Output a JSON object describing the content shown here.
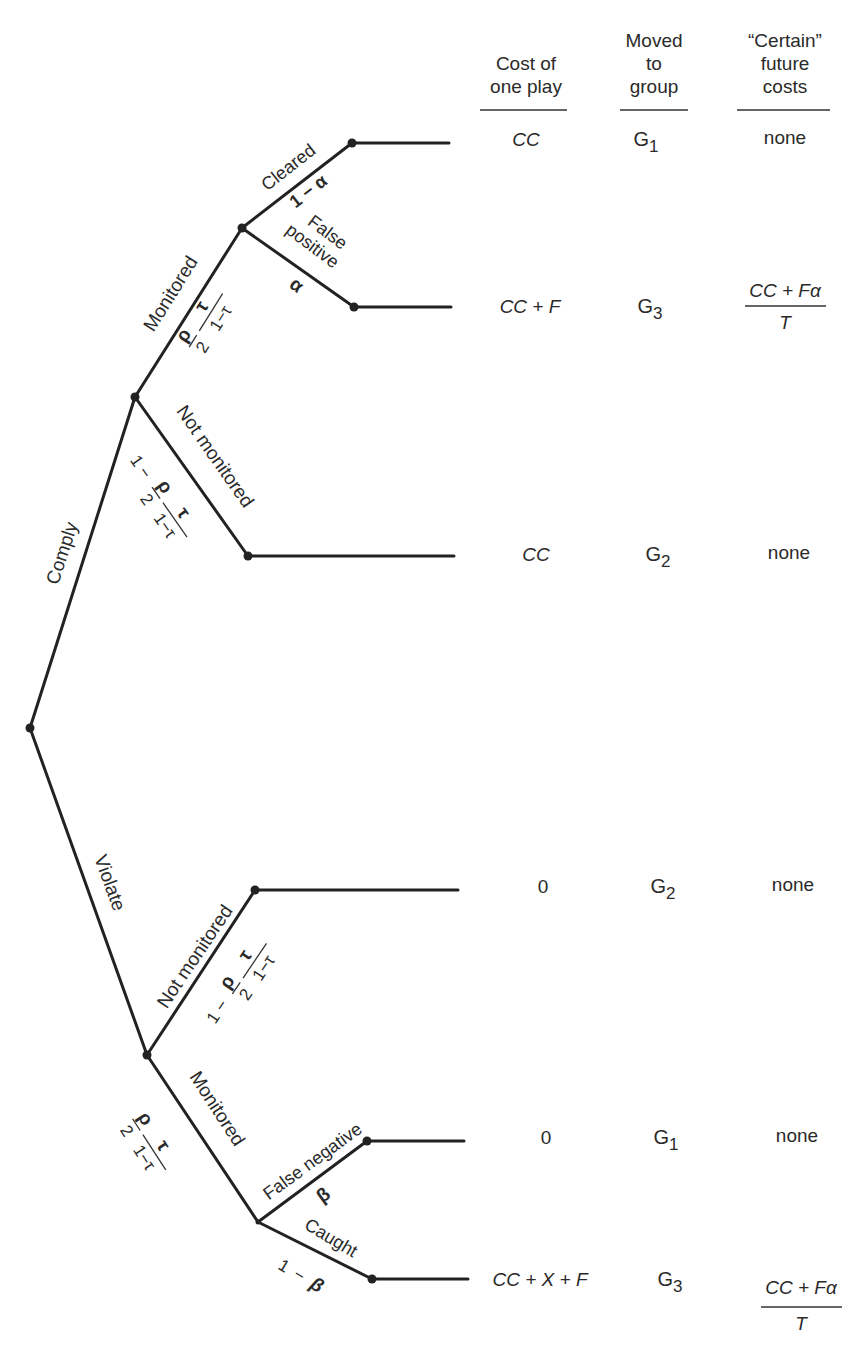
{
  "header": {
    "col_cost": [
      "Cost of",
      "one play"
    ],
    "col_group": [
      "Moved",
      "to",
      "group"
    ],
    "col_future": [
      "“Certain”",
      "future",
      "costs"
    ]
  },
  "branches": {
    "comply": "Comply",
    "violate": "Violate",
    "comply_monitored": "Monitored",
    "comply_not_monitored": "Not monitored",
    "cleared": "Cleared",
    "false_positive": [
      "False",
      "positive"
    ],
    "violate_not_monitored": "Not monitored",
    "violate_monitored": "Monitored",
    "false_negative": "False negative",
    "caught": "Caught"
  },
  "probabilities": {
    "monitor_p_num": "ρ",
    "monitor_p_den": "2",
    "monitor_t_num": "τ",
    "monitor_t_den": "1−τ",
    "one_minus": "1 −",
    "cleared": "1 − α",
    "false_positive": "α",
    "false_negative": "β",
    "caught_one": "1",
    "caught_minus": "−",
    "caught_beta": "β"
  },
  "outcomes": [
    {
      "cost": "CC",
      "group": "G",
      "group_sub": "1",
      "future": "none"
    },
    {
      "cost": "CC + F",
      "group": "G",
      "group_sub": "3",
      "future_num": "CC + Fα",
      "future_den": "T"
    },
    {
      "cost": "CC",
      "group": "G",
      "group_sub": "2",
      "future": "none"
    },
    {
      "cost": "0",
      "group": "G",
      "group_sub": "2",
      "future": "none"
    },
    {
      "cost": "0",
      "group": "G",
      "group_sub": "1",
      "future": "none"
    },
    {
      "cost": "CC + X + F",
      "group": "G",
      "group_sub": "3",
      "future_num": "CC + Fα",
      "future_den": "T"
    }
  ]
}
